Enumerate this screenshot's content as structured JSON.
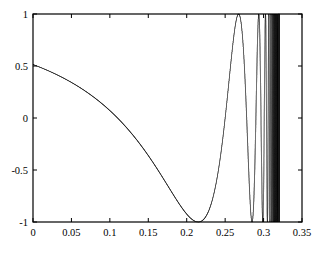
{
  "figure": {
    "background_color": "#ffffff",
    "axes_color": "#000000",
    "line_color": "#1a1a1a"
  },
  "chart_data": {
    "type": "line",
    "title": "",
    "xlabel": "",
    "ylabel": "",
    "xlim": [
      0,
      0.35
    ],
    "ylim": [
      -1,
      1
    ],
    "grid": false,
    "legend": null,
    "xticks": [
      0,
      0.05,
      0.1,
      0.15,
      0.2,
      0.25,
      0.3,
      0.35
    ],
    "xticklabels": [
      "0",
      "0.05",
      "0.1",
      "0.15",
      "0.2",
      "0.25",
      "0.3",
      "0.35"
    ],
    "yticks": [
      -1,
      -0.5,
      0,
      0.5,
      1
    ],
    "yticklabels": [
      "-1",
      "-0.5",
      "0",
      "0.5",
      "1"
    ],
    "series": [
      {
        "name": "chirp",
        "description": "Decreasing-frequency chirp: cosine whose instantaneous frequency falls from very high near x=0 to zero at the right end of the trace. Oscillations are unresolvably dense for x<0.02 (solid black band), separate into distinct lobes from x~0.02 to x~0.13, then one long final lobe ending at x=0.32 with value 0.",
        "x_start": 0,
        "x_end": 0.32,
        "peaks_x": [
          0.0718,
          0.1278
        ],
        "minima_x": [
          0.0922,
          0.215
        ],
        "zero_crossings_x": [
          0.107,
          0.165,
          0.32
        ],
        "y_at_end": 0,
        "amplitude": 1,
        "formula": "cos(2*pi*k/(0.32 - x)) style decreasing chirp, phase = pi*(0.32-x)^2/ c"
      }
    ]
  }
}
